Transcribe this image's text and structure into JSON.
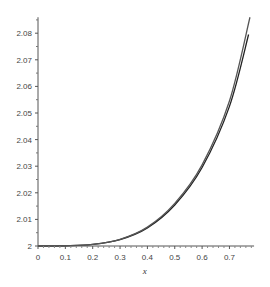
{
  "chart_data": {
    "type": "line",
    "title": "",
    "xlabel": "x",
    "ylabel": "",
    "xlim": [
      0,
      0.79
    ],
    "ylim": [
      2,
      2.086
    ],
    "x_ticks": [
      "0",
      "0.1",
      "0.2",
      "0.3",
      "0.4",
      "0.5",
      "0.6",
      "0.7"
    ],
    "y_ticks": [
      "2",
      "2.01",
      "2.02",
      "2.03",
      "2.04",
      "2.05",
      "2.06",
      "2.07",
      "2.08"
    ],
    "grid": false,
    "legend": null,
    "series": [
      {
        "name": "curve 1",
        "color": "#222222",
        "x": [
          0,
          0.1,
          0.2,
          0.3,
          0.4,
          0.5,
          0.6,
          0.7,
          0.77
        ],
        "values": [
          2.0,
          2.0001,
          2.0006,
          2.0024,
          2.0068,
          2.0154,
          2.0295,
          2.0525,
          2.0795
        ]
      },
      {
        "name": "curve 2",
        "color": "#555555",
        "x": [
          0,
          0.1,
          0.2,
          0.3,
          0.4,
          0.5,
          0.6,
          0.7,
          0.775
        ],
        "values": [
          2.0,
          2.0001,
          2.0006,
          2.0025,
          2.0071,
          2.016,
          2.0305,
          2.0545,
          2.086
        ]
      }
    ]
  }
}
